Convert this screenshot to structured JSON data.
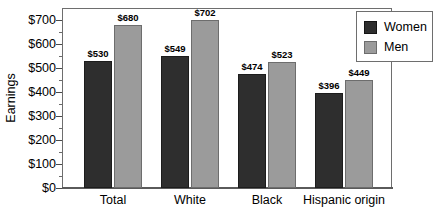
{
  "chart_data": {
    "type": "bar",
    "title": "",
    "xlabel": "",
    "ylabel": "Earnings",
    "categories": [
      "Total",
      "White",
      "Black",
      "Hispanic origin"
    ],
    "series": [
      {
        "name": "Women",
        "color": "#2e2e2e",
        "values": [
          530,
          549,
          474,
          396
        ]
      },
      {
        "name": "Men",
        "color": "#9b9b9b",
        "values": [
          680,
          702,
          523,
          449
        ]
      }
    ],
    "value_labels": [
      [
        "$530",
        "$549",
        "$474",
        "$396"
      ],
      [
        "$680",
        "$702",
        "$523",
        "$449"
      ]
    ],
    "ylim": [
      0,
      700
    ],
    "ytick_values": [
      0,
      100,
      200,
      300,
      400,
      500,
      600,
      700
    ],
    "ytick_labels": [
      "$0",
      "$100",
      "$200",
      "$300",
      "$400",
      "$500",
      "$600",
      "$700"
    ],
    "yminor_values": [
      50,
      150,
      250,
      350,
      450,
      550,
      650
    ],
    "grid": false,
    "legend_position": "top-right",
    "legend_entries": [
      "Women",
      "Men"
    ]
  }
}
